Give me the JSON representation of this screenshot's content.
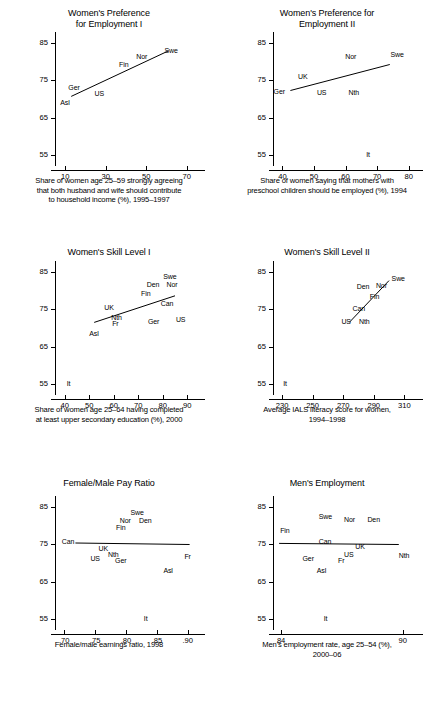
{
  "figure": {
    "panel_count": 6,
    "y_axis_label": "Women's employment rate,\nage 25–54 (%), 2000–06",
    "y_ticks": [
      "85",
      "75",
      "65",
      "55"
    ]
  },
  "chart_data": [
    {
      "type": "scatter",
      "title": "Women's Preference\nfor Employment I",
      "title_line1": "Women's Preference",
      "title_line2": "for Employment I",
      "xlabel": "Share of women age 25–59 strongly agreeing\nthat both husband and wife should contribute\nto household income (%), 1995–1997",
      "xlabel_line1": "Share of women age 25–59 strongly agreeing",
      "xlabel_line2": "that both husband and wife should contribute",
      "xlabel_line3": "to household income (%), 1995–1997",
      "ylabel_line1": "Women's employment rate,",
      "ylabel_line2": "age 25–54 (%), 2000–06",
      "xlim": [
        5,
        75
      ],
      "ylim": [
        53,
        87
      ],
      "xticks": [
        "10",
        "30",
        "50",
        "70"
      ],
      "xtick_values": [
        10,
        30,
        50,
        70
      ],
      "yticks": [
        "85",
        "75",
        "65",
        "55"
      ],
      "ytick_values": [
        85,
        75,
        65,
        55
      ],
      "points": [
        {
          "label": "Asl",
          "x": 13,
          "y": 69.5
        },
        {
          "label": "Ger",
          "x": 17,
          "y": 71.5
        },
        {
          "label": "US",
          "x": 27,
          "y": 72.0
        },
        {
          "label": "Fin",
          "x": 40,
          "y": 77.5
        },
        {
          "label": "Nor",
          "x": 48,
          "y": 79.5
        },
        {
          "label": "Swe",
          "x": 59,
          "y": 82.0
        }
      ],
      "fit_line": {
        "x1": 13,
        "y1": 70.7,
        "x2": 61,
        "y2": 83.0
      }
    },
    {
      "type": "scatter",
      "title": "Women's Preference for\nEmployment II",
      "title_line1": "Women's Preference for",
      "title_line2": "Employment II",
      "xlabel": "Share of women saying that mothers with\npreschool children should be employed (%), 1994",
      "xlabel_line1": "Share of women saying that mothers with",
      "xlabel_line2": "preschool children should be employed (%), 1994",
      "xlabel_line3": "",
      "ylabel_line1": "Women's employment rate,",
      "ylabel_line2": "age 25–54 (%), 2000–06",
      "xlim": [
        37,
        82
      ],
      "ylim": [
        53,
        87
      ],
      "xticks": [
        "40",
        "50",
        "60",
        "70",
        "80"
      ],
      "xtick_values": [
        40,
        50,
        60,
        70,
        80
      ],
      "yticks": [
        "85",
        "75",
        "65",
        "55"
      ],
      "ytick_values": [
        85,
        75,
        65,
        55
      ],
      "points": [
        {
          "label": "Ger",
          "x": 41.0,
          "y": 71.8
        },
        {
          "label": "UK",
          "x": 46.5,
          "y": 74.0
        },
        {
          "label": "US",
          "x": 52.5,
          "y": 72.0
        },
        {
          "label": "Nor",
          "x": 61.5,
          "y": 79.5
        },
        {
          "label": "Nth",
          "x": 62.5,
          "y": 72.0
        },
        {
          "label": "It",
          "x": 67.5,
          "y": 55.0
        },
        {
          "label": "Swe",
          "x": 75.5,
          "y": 80.0
        }
      ],
      "fit_line": {
        "x1": 42.5,
        "y1": 72.3,
        "x2": 74.0,
        "y2": 79.3
      }
    },
    {
      "type": "scatter",
      "title": "Women's Skill Level I",
      "title_line1": "Women's Skill Level I",
      "title_line2": "",
      "xlabel": "Share of women age 25–64 having completed\nat least upper secondary education (%), 2000",
      "xlabel_line1": "Share of women age 25–64 having completed",
      "xlabel_line2": "at least upper secondary education (%), 2000",
      "xlabel_line3": "",
      "ylabel_line1": "Women's employment rate,",
      "ylabel_line2": "age 25–54 (%), 2000–06",
      "xlim": [
        36,
        94
      ],
      "ylim": [
        53,
        87
      ],
      "xticks": [
        "40",
        "50",
        "60",
        "70",
        "80",
        "90"
      ],
      "xtick_values": [
        40,
        50,
        60,
        70,
        80,
        90
      ],
      "yticks": [
        "85",
        "75",
        "65",
        "55"
      ],
      "ytick_values": [
        85,
        75,
        65,
        55
      ],
      "points": [
        {
          "label": "It",
          "x": 42,
          "y": 55.0
        },
        {
          "label": "Asl",
          "x": 52,
          "y": 69.3
        },
        {
          "label": "UK",
          "x": 59,
          "y": 73.8
        },
        {
          "label": "Nth",
          "x": 61,
          "y": 72.5
        },
        {
          "label": "Fr",
          "x": 61,
          "y": 71.8
        },
        {
          "label": "Fin",
          "x": 74,
          "y": 78.3
        },
        {
          "label": "Den",
          "x": 78,
          "y": 80.5
        },
        {
          "label": "Swe",
          "x": 81,
          "y": 81.5
        },
        {
          "label": "Nor",
          "x": 82,
          "y": 80.5
        },
        {
          "label": "Can",
          "x": 80,
          "y": 75.8
        },
        {
          "label": "Ger",
          "x": 76,
          "y": 72.0
        },
        {
          "label": "US",
          "x": 87,
          "y": 72.2
        }
      ],
      "fit_line": {
        "x1": 52,
        "y1": 71.5,
        "x2": 85,
        "y2": 78.7
      }
    },
    {
      "type": "scatter",
      "title": "Women's Skill Level II",
      "title_line1": "Women's Skill Level II",
      "title_line2": "",
      "xlabel": "Average IALS literacy score for women,\n1994–1998",
      "xlabel_line1": "Average IALS literacy score for women,",
      "xlabel_line2": "1994–1998",
      "xlabel_line3": "",
      "ylabel_line1": "Women's employment rate,",
      "ylabel_line2": "age 25–54 (%), 2000–06",
      "xlim": [
        224,
        317
      ],
      "ylim": [
        53,
        87
      ],
      "xticks": [
        "230",
        "250",
        "270",
        "290",
        "310"
      ],
      "xtick_values": [
        230,
        250,
        270,
        290,
        310
      ],
      "yticks": [
        "85",
        "75",
        "65",
        "55"
      ],
      "ytick_values": [
        85,
        75,
        65,
        55
      ],
      "points": [
        {
          "label": "It",
          "x": 232,
          "y": 55.0
        },
        {
          "label": "US",
          "x": 276,
          "y": 72.3
        },
        {
          "label": "Nth",
          "x": 281,
          "y": 72.3
        },
        {
          "label": "Can",
          "x": 282,
          "y": 75.0
        },
        {
          "label": "Fin",
          "x": 290,
          "y": 78.0
        },
        {
          "label": "Den",
          "x": 288,
          "y": 80.0
        },
        {
          "label": "Nor",
          "x": 294,
          "y": 80.2
        },
        {
          "label": "Swe",
          "x": 301,
          "y": 81.8
        }
      ],
      "fit_line": {
        "x1": 274,
        "y1": 71.5,
        "x2": 300,
        "y2": 82.8
      }
    },
    {
      "type": "scatter",
      "title": "Female/Male Pay Ratio",
      "title_line1": "Female/Male Pay Ratio",
      "title_line2": "",
      "xlabel": "Female/male earnings ratio, 1998",
      "xlabel_line1": "Female/male earnings ratio, 1998",
      "xlabel_line2": "",
      "xlabel_line3": "",
      "ylabel_line1": "Women's employment rate,",
      "ylabel_line2": "age 25–54 (%), 2000–06",
      "xlim": [
        0.685,
        0.915
      ],
      "ylim": [
        53,
        87
      ],
      "xticks": [
        ".70",
        ".75",
        ".80",
        ".85",
        ".90"
      ],
      "xtick_values": [
        0.7,
        0.75,
        0.8,
        0.85,
        0.9
      ],
      "yticks": [
        "85",
        "75",
        "65",
        "55"
      ],
      "ytick_values": [
        85,
        75,
        65,
        55
      ],
      "points": [
        {
          "label": "Can",
          "x": 0.712,
          "y": 75.2
        },
        {
          "label": "US",
          "x": 0.752,
          "y": 72.3
        },
        {
          "label": "UK",
          "x": 0.762,
          "y": 73.3
        },
        {
          "label": "Nth",
          "x": 0.779,
          "y": 72.6
        },
        {
          "label": "Ger",
          "x": 0.784,
          "y": 72.0
        },
        {
          "label": "Fin",
          "x": 0.792,
          "y": 78.0
        },
        {
          "label": "Nor",
          "x": 0.806,
          "y": 80.3
        },
        {
          "label": "Swe",
          "x": 0.812,
          "y": 81.3
        },
        {
          "label": "Den",
          "x": 0.821,
          "y": 80.3
        },
        {
          "label": "It",
          "x": 0.832,
          "y": 55.0
        },
        {
          "label": "Asl",
          "x": 0.867,
          "y": 68.8
        },
        {
          "label": "Fr",
          "x": 0.901,
          "y": 72.0
        }
      ],
      "fit_line": {
        "x1": 0.718,
        "y1": 75.4,
        "x2": 0.903,
        "y2": 75.0
      }
    },
    {
      "type": "scatter",
      "title": "Men's Employment",
      "title_line1": "Men's Employment",
      "title_line2": "",
      "xlabel": "Men's employment rate, age 25–54 (%),\n2000–06",
      "xlabel_line1": "Men's employment rate, age 25–54 (%),",
      "xlabel_line2": "2000–06",
      "xlabel_line3": "",
      "ylabel_line1": "Women's employment rate,",
      "ylabel_line2": "age 25–54 (%), 2000–06",
      "xlim": [
        83.6,
        90.6
      ],
      "ylim": [
        53,
        87
      ],
      "xticks": [
        "84",
        "90"
      ],
      "xtick_values": [
        84,
        90
      ],
      "yticks": [
        "85",
        "75",
        "65",
        "55"
      ],
      "ytick_values": [
        85,
        75,
        65,
        55
      ],
      "points": [
        {
          "label": "Fin",
          "x": 84.2,
          "y": 77.9
        },
        {
          "label": "Ger",
          "x": 85.3,
          "y": 72.0
        },
        {
          "label": "Asl",
          "x": 86.0,
          "y": 69.0
        },
        {
          "label": "Swe",
          "x": 86.1,
          "y": 80.5
        },
        {
          "label": "It",
          "x": 86.2,
          "y": 55.0
        },
        {
          "label": "Can",
          "x": 86.2,
          "y": 75.2
        },
        {
          "label": "Fr",
          "x": 87.1,
          "y": 71.6
        },
        {
          "label": "US",
          "x": 87.2,
          "y": 72.4
        },
        {
          "label": "Nor",
          "x": 87.3,
          "y": 80.1
        },
        {
          "label": "UK",
          "x": 87.7,
          "y": 73.4
        },
        {
          "label": "Den",
          "x": 88.4,
          "y": 80.1
        },
        {
          "label": "Nth",
          "x": 90.0,
          "y": 72.2
        }
      ],
      "fit_line": {
        "x1": 83.9,
        "y1": 75.3,
        "x2": 89.8,
        "y2": 75.0
      }
    }
  ]
}
